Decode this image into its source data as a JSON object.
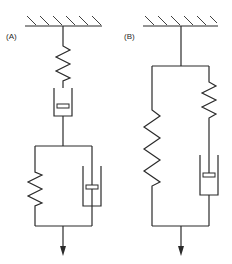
{
  "diagram": {
    "models": [
      {
        "label": "(A)",
        "name": "Burgers-type model",
        "components": [
          {
            "type": "spring",
            "arrangement": "series"
          },
          {
            "type": "dashpot",
            "arrangement": "series"
          },
          {
            "type": "kelvin-voigt-element",
            "parts": [
              "spring",
              "dashpot"
            ],
            "arrangement": "parallel"
          }
        ]
      },
      {
        "label": "(B)",
        "name": "Standard linear solid (Zener) model",
        "components": [
          {
            "type": "spring",
            "arrangement": "parallel-branch-left"
          },
          {
            "type": "maxwell-element",
            "parts": [
              "spring",
              "dashpot"
            ],
            "arrangement": "parallel-branch-right"
          }
        ]
      }
    ],
    "load": "downward-arrow"
  }
}
